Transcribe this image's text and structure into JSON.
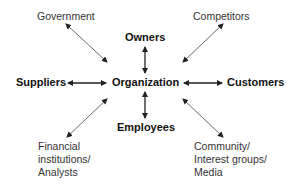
{
  "diagram": {
    "center": {
      "label": "Organization"
    },
    "nodes": {
      "government": {
        "label": "Government"
      },
      "owners": {
        "label": "Owners"
      },
      "competitors": {
        "label": "Competitors"
      },
      "suppliers": {
        "label": "Suppliers"
      },
      "customers": {
        "label": "Customers"
      },
      "employees": {
        "label": "Employees"
      },
      "financial": {
        "label": "Financial\ninstitutions/\nAnalysts"
      },
      "community": {
        "label": "Community/\nInterest groups/\nMedia"
      }
    },
    "edges": [
      {
        "from": "Organization",
        "to": "Government",
        "type": "bidirectional"
      },
      {
        "from": "Organization",
        "to": "Owners",
        "type": "bidirectional"
      },
      {
        "from": "Organization",
        "to": "Competitors",
        "type": "bidirectional"
      },
      {
        "from": "Organization",
        "to": "Suppliers",
        "type": "bidirectional"
      },
      {
        "from": "Organization",
        "to": "Customers",
        "type": "bidirectional"
      },
      {
        "from": "Organization",
        "to": "Employees",
        "type": "bidirectional"
      },
      {
        "from": "Organization",
        "to": "Financial institutions/Analysts",
        "type": "bidirectional"
      },
      {
        "from": "Organization",
        "to": "Community/Interest groups/Media",
        "type": "bidirectional"
      }
    ],
    "colors": {
      "text": "#111111",
      "arrow": "#222222",
      "background": "#ffffff"
    }
  }
}
